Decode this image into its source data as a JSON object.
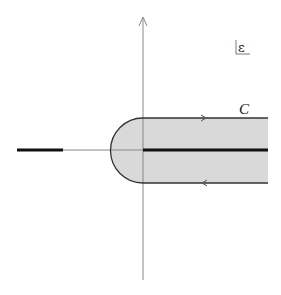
{
  "diagram": {
    "plane_label": "ε",
    "contour_label": "C",
    "colors": {
      "background": "#ffffff",
      "region_fill": "#d9d9d9",
      "contour_stroke": "#333333",
      "axis_stroke": "#888888",
      "cut_stroke": "#111111"
    },
    "elements": {
      "vertical_axis": {
        "x": 143,
        "y_top": 18,
        "y_bottom": 280,
        "arrow": "up"
      },
      "horizontal_axis": {
        "y": 150,
        "x_left": 63,
        "x_right": 268
      },
      "left_cut": {
        "x1": 17,
        "x2": 63,
        "y": 150
      },
      "right_cut": {
        "x1": 143,
        "x2": 268,
        "y": 150
      },
      "contour": {
        "upper_edge_y": 118,
        "lower_edge_y": 183,
        "arc_center_x": 143,
        "arc_left_x": 110,
        "right_end_x": 268,
        "upper_arrow": {
          "x": 205,
          "direction": "right"
        },
        "lower_arrow": {
          "x": 203,
          "direction": "left"
        }
      }
    }
  }
}
